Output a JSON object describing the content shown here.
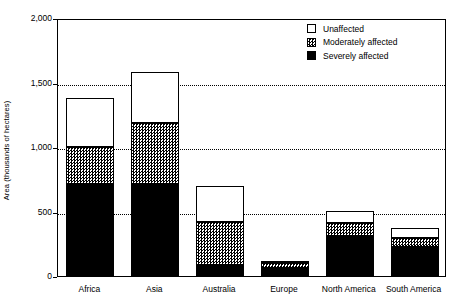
{
  "chart_data": {
    "type": "bar",
    "subtype": "stacked-vertical",
    "title": "",
    "xlabel": "",
    "ylabel": "Area (thousands of hectares)",
    "ylim": [
      0,
      2000
    ],
    "yticks": [
      0,
      500,
      1000,
      1500,
      2000
    ],
    "ytick_labels": [
      "0",
      "500",
      "1,000",
      "1,500",
      "2,000"
    ],
    "grid": "horizontal-dotted",
    "legend_position": "top-right",
    "categories": [
      "Africa",
      "Asia",
      "Australia",
      "Europe",
      "North America",
      "South America"
    ],
    "series": [
      {
        "name": "Severely affected",
        "fill": "solid-black",
        "color": "#000000",
        "values": [
          710,
          710,
          85,
          60,
          310,
          225
        ]
      },
      {
        "name": "Moderately affected",
        "fill": "checker-gray",
        "color": "#9a9a9a",
        "values": [
          290,
          480,
          335,
          40,
          100,
          70
        ]
      },
      {
        "name": "Unaffected",
        "fill": "white",
        "color": "#ffffff",
        "values": [
          380,
          390,
          280,
          15,
          95,
          80
        ]
      }
    ],
    "totals": [
      1380,
      1580,
      700,
      115,
      505,
      375
    ]
  },
  "legend": {
    "items": [
      {
        "label": "Unaffected",
        "swatch": "white"
      },
      {
        "label": "Moderately affected",
        "swatch": "checker"
      },
      {
        "label": "Severely affected",
        "swatch": "black"
      }
    ]
  }
}
